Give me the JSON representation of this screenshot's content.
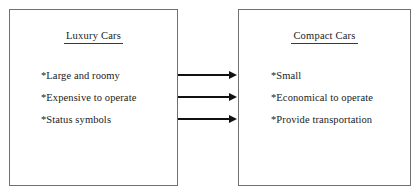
{
  "diagram": {
    "type": "comparison-chart",
    "background_color": "#ffffff",
    "border_color": "#707070",
    "text_color": "#1a1a1a",
    "arrow_color": "#111111",
    "left_box": {
      "title": "Luxury Cars",
      "items": [
        {
          "mark": "*",
          "text": "Large and roomy"
        },
        {
          "mark": "*",
          "text": "Expensive to operate"
        },
        {
          "mark": "*",
          "text": "Status symbols"
        }
      ]
    },
    "right_box": {
      "title": "Compact Cars",
      "items": [
        {
          "mark": "*",
          "text": "Small"
        },
        {
          "mark": "*",
          "text": "Economical to operate"
        },
        {
          "mark": "*",
          "text": "Provide transportation"
        }
      ]
    },
    "connectors": [
      {
        "icon": "arrow-right-icon",
        "from": "Large and roomy",
        "to": "Small"
      },
      {
        "icon": "arrow-right-icon",
        "from": "Expensive to operate",
        "to": "Economical to operate"
      },
      {
        "icon": "arrow-right-icon",
        "from": "Status symbols",
        "to": "Provide transportation"
      }
    ]
  }
}
